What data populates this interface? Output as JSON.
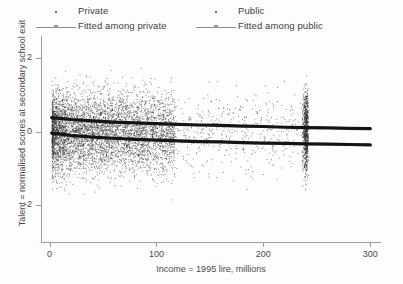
{
  "chart_data": {
    "type": "scatter",
    "title": "",
    "xlabel": "Income = 1995 lire, millions",
    "ylabel": "Talent = normalised scores at secondary school exit",
    "xlim": [
      -8,
      310
    ],
    "ylim": [
      -3.0,
      2.6
    ],
    "xticks": [
      0,
      100,
      200,
      300
    ],
    "xtick_labels": [
      "0",
      "100",
      "200",
      "300"
    ],
    "yticks": [
      2,
      0,
      -2
    ],
    "ytick_labels": [
      "2",
      "0",
      "-2"
    ],
    "grid": false,
    "legend_position": "top",
    "legend": [
      {
        "name": "Private",
        "marker": "dot",
        "color": "#555555"
      },
      {
        "name": "Fitted among private",
        "marker": "line",
        "color": "#1a1a1a"
      },
      {
        "name": "Public",
        "marker": "dot",
        "color": "#555555"
      },
      {
        "name": "Fitted among public",
        "marker": "line",
        "color": "#1a1a1a"
      }
    ],
    "annotations": [
      "Dense point cloud concentrated at low incomes (0-120 million lire)",
      "Vertical top-coded income cluster near 240 million lire"
    ],
    "series": [
      {
        "name": "Fitted among private",
        "type": "line",
        "x": [
          2,
          20,
          40,
          60,
          80,
          100,
          120,
          140,
          160,
          180,
          200,
          220,
          240,
          260,
          280,
          300
        ],
        "y": [
          0.38,
          0.33,
          0.29,
          0.26,
          0.24,
          0.22,
          0.2,
          0.18,
          0.17,
          0.15,
          0.14,
          0.12,
          0.11,
          0.1,
          0.09,
          0.08
        ]
      },
      {
        "name": "Fitted among public",
        "type": "line",
        "x": [
          2,
          20,
          40,
          60,
          80,
          100,
          120,
          140,
          160,
          180,
          200,
          220,
          240,
          260,
          280,
          300
        ],
        "y": [
          -0.04,
          -0.1,
          -0.15,
          -0.18,
          -0.21,
          -0.23,
          -0.25,
          -0.27,
          -0.28,
          -0.3,
          -0.31,
          -0.32,
          -0.33,
          -0.34,
          -0.35,
          -0.36
        ]
      }
    ],
    "scatter_description": {
      "point_count_approx": 6000,
      "point_color": "#2e2e2e",
      "point_size_px": 1,
      "x_distribution": "right-skewed, mode near 35",
      "y_distribution": "approximately normal, mean 0, sd 0.9"
    }
  }
}
